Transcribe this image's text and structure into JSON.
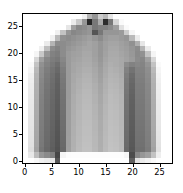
{
  "figure": {
    "kind": "matplotlib-imshow",
    "background_color": "#ffffff",
    "axes_edge_color": "#000000",
    "tick_color": "#000000",
    "tick_label_color": "#000000"
  },
  "axes": {
    "xaxis": {
      "ticks": [
        0,
        5,
        10,
        15,
        20,
        25
      ],
      "tick_labels": [
        "0",
        "5",
        "10",
        "15",
        "20",
        "25"
      ],
      "limits": [
        -0.5,
        27.5
      ]
    },
    "yaxis": {
      "ticks": [
        0,
        5,
        10,
        15,
        20,
        25
      ],
      "tick_labels": [
        "0",
        "5",
        "10",
        "15",
        "20",
        "25"
      ],
      "limits": [
        27.5,
        -0.5
      ],
      "inverted": true
    }
  },
  "chart_data": {
    "type": "heatmap",
    "title": "",
    "xlabel": "",
    "ylabel": "",
    "colormap": "gray",
    "vmin": 0,
    "vmax": 255,
    "width": 28,
    "height": 28,
    "xlim": [
      -0.5,
      27.5
    ],
    "ylim": [
      27.5,
      -0.5
    ],
    "grid": false,
    "legend": null,
    "x": [
      0,
      1,
      2,
      3,
      4,
      5,
      6,
      7,
      8,
      9,
      10,
      11,
      12,
      13,
      14,
      15,
      16,
      17,
      18,
      19,
      20,
      21,
      22,
      23,
      24,
      25,
      26,
      27
    ],
    "y": [
      0,
      1,
      2,
      3,
      4,
      5,
      6,
      7,
      8,
      9,
      10,
      11,
      12,
      13,
      14,
      15,
      16,
      17,
      18,
      19,
      20,
      21,
      22,
      23,
      24,
      25,
      26,
      27
    ],
    "values": [
      [
        255,
        255,
        255,
        255,
        255,
        255,
        255,
        255,
        255,
        255,
        255,
        240,
        180,
        150,
        205,
        185,
        230,
        255,
        255,
        255,
        255,
        255,
        255,
        255,
        255,
        255,
        255,
        255
      ],
      [
        255,
        255,
        255,
        255,
        255,
        255,
        255,
        255,
        255,
        235,
        200,
        150,
        40,
        120,
        170,
        45,
        120,
        215,
        250,
        255,
        255,
        255,
        255,
        255,
        255,
        255,
        255,
        255
      ],
      [
        255,
        255,
        255,
        255,
        255,
        255,
        255,
        255,
        230,
        160,
        135,
        140,
        150,
        120,
        130,
        130,
        140,
        160,
        225,
        250,
        255,
        255,
        255,
        255,
        255,
        255,
        255,
        255
      ],
      [
        255,
        255,
        255,
        255,
        255,
        255,
        240,
        195,
        150,
        135,
        140,
        145,
        150,
        85,
        120,
        150,
        150,
        150,
        155,
        205,
        245,
        255,
        255,
        255,
        255,
        255,
        255,
        255
      ],
      [
        255,
        255,
        255,
        255,
        255,
        240,
        185,
        145,
        140,
        145,
        150,
        155,
        160,
        150,
        140,
        155,
        160,
        160,
        155,
        150,
        185,
        235,
        255,
        255,
        255,
        255,
        255,
        255
      ],
      [
        255,
        255,
        255,
        255,
        235,
        180,
        140,
        140,
        145,
        150,
        155,
        160,
        165,
        160,
        150,
        160,
        165,
        165,
        160,
        155,
        145,
        175,
        230,
        255,
        255,
        255,
        255,
        255
      ],
      [
        255,
        255,
        255,
        240,
        190,
        140,
        130,
        140,
        150,
        155,
        160,
        165,
        165,
        160,
        150,
        160,
        168,
        168,
        162,
        158,
        150,
        140,
        180,
        235,
        255,
        255,
        255,
        255
      ],
      [
        255,
        255,
        245,
        200,
        150,
        130,
        125,
        140,
        155,
        160,
        162,
        168,
        168,
        160,
        150,
        162,
        170,
        170,
        165,
        160,
        152,
        138,
        145,
        195,
        245,
        255,
        255,
        255
      ],
      [
        255,
        255,
        215,
        160,
        135,
        125,
        120,
        135,
        155,
        162,
        165,
        170,
        170,
        162,
        152,
        165,
        172,
        172,
        168,
        162,
        155,
        140,
        135,
        160,
        215,
        255,
        255,
        255
      ],
      [
        255,
        250,
        195,
        145,
        130,
        120,
        110,
        130,
        155,
        165,
        168,
        172,
        172,
        165,
        155,
        168,
        175,
        172,
        168,
        140,
        130,
        135,
        132,
        148,
        195,
        250,
        255,
        255
      ],
      [
        255,
        245,
        185,
        140,
        125,
        115,
        105,
        125,
        155,
        165,
        170,
        175,
        175,
        168,
        158,
        170,
        178,
        175,
        170,
        130,
        115,
        130,
        130,
        142,
        185,
        245,
        255,
        255
      ],
      [
        255,
        240,
        180,
        138,
        122,
        112,
        100,
        122,
        155,
        168,
        172,
        178,
        178,
        170,
        160,
        172,
        180,
        178,
        172,
        125,
        108,
        128,
        128,
        140,
        180,
        242,
        255,
        255
      ],
      [
        255,
        238,
        178,
        135,
        120,
        110,
        98,
        120,
        155,
        168,
        175,
        180,
        180,
        172,
        162,
        175,
        182,
        180,
        175,
        122,
        105,
        126,
        126,
        138,
        178,
        240,
        255,
        255
      ],
      [
        255,
        236,
        176,
        133,
        118,
        108,
        96,
        118,
        155,
        170,
        176,
        182,
        182,
        175,
        165,
        176,
        184,
        182,
        176,
        120,
        102,
        124,
        124,
        136,
        176,
        238,
        255,
        255
      ],
      [
        255,
        235,
        175,
        132,
        116,
        106,
        95,
        116,
        155,
        170,
        178,
        184,
        184,
        176,
        166,
        178,
        186,
        184,
        178,
        118,
        100,
        123,
        123,
        135,
        175,
        237,
        255,
        255
      ],
      [
        255,
        234,
        174,
        130,
        115,
        105,
        94,
        115,
        155,
        172,
        180,
        185,
        185,
        178,
        168,
        180,
        188,
        185,
        180,
        116,
        98,
        122,
        122,
        134,
        174,
        236,
        255,
        255
      ],
      [
        255,
        233,
        173,
        129,
        114,
        104,
        93,
        114,
        156,
        172,
        180,
        186,
        186,
        178,
        168,
        180,
        188,
        186,
        180,
        115,
        97,
        121,
        121,
        133,
        173,
        235,
        255,
        255
      ],
      [
        255,
        232,
        172,
        128,
        113,
        103,
        92,
        113,
        156,
        173,
        181,
        187,
        187,
        180,
        170,
        182,
        189,
        187,
        181,
        114,
        96,
        120,
        120,
        132,
        172,
        234,
        255,
        255
      ],
      [
        255,
        231,
        171,
        127,
        112,
        102,
        91,
        112,
        157,
        173,
        182,
        188,
        188,
        180,
        170,
        182,
        190,
        188,
        182,
        113,
        95,
        119,
        119,
        131,
        171,
        233,
        255,
        255
      ],
      [
        255,
        230,
        170,
        126,
        111,
        101,
        90,
        111,
        157,
        174,
        182,
        188,
        188,
        181,
        171,
        183,
        190,
        188,
        182,
        112,
        94,
        118,
        118,
        130,
        170,
        232,
        255,
        255
      ],
      [
        255,
        229,
        169,
        125,
        110,
        100,
        88,
        110,
        158,
        174,
        183,
        189,
        189,
        182,
        172,
        184,
        191,
        189,
        183,
        111,
        93,
        117,
        117,
        129,
        169,
        231,
        255,
        255
      ],
      [
        255,
        228,
        168,
        124,
        109,
        99,
        87,
        109,
        158,
        175,
        184,
        190,
        190,
        182,
        172,
        184,
        192,
        190,
        184,
        110,
        92,
        116,
        116,
        128,
        168,
        230,
        255,
        255
      ],
      [
        255,
        227,
        167,
        123,
        108,
        98,
        86,
        108,
        158,
        175,
        184,
        190,
        190,
        183,
        173,
        185,
        192,
        190,
        184,
        109,
        91,
        115,
        115,
        127,
        167,
        229,
        255,
        255
      ],
      [
        255,
        226,
        166,
        122,
        107,
        97,
        85,
        107,
        159,
        176,
        185,
        191,
        191,
        184,
        174,
        186,
        193,
        191,
        185,
        108,
        90,
        114,
        114,
        126,
        166,
        228,
        255,
        255
      ],
      [
        255,
        225,
        165,
        121,
        106,
        96,
        84,
        106,
        159,
        176,
        186,
        192,
        192,
        184,
        174,
        186,
        194,
        192,
        186,
        107,
        89,
        113,
        113,
        125,
        165,
        227,
        255,
        255
      ],
      [
        255,
        222,
        162,
        118,
        104,
        94,
        82,
        104,
        160,
        177,
        187,
        193,
        193,
        185,
        175,
        187,
        195,
        193,
        187,
        105,
        87,
        111,
        111,
        123,
        162,
        225,
        255,
        255
      ],
      [
        255,
        232,
        188,
        150,
        138,
        128,
        70,
        245,
        252,
        253,
        253,
        253,
        253,
        253,
        253,
        253,
        253,
        253,
        253,
        247,
        75,
        135,
        150,
        160,
        195,
        238,
        255,
        255
      ],
      [
        255,
        255,
        248,
        240,
        235,
        230,
        85,
        255,
        255,
        255,
        255,
        255,
        255,
        255,
        255,
        255,
        255,
        255,
        255,
        255,
        95,
        225,
        235,
        242,
        250,
        255,
        255,
        255
      ]
    ]
  }
}
